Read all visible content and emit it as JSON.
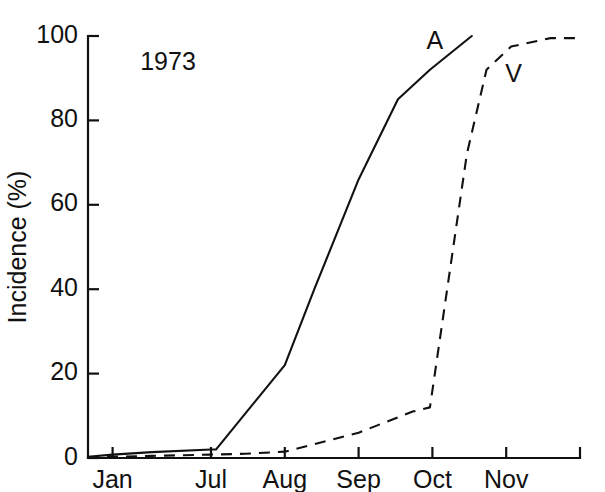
{
  "chart_data": {
    "type": "line",
    "title": "",
    "annotation": "1973",
    "xlabel": "",
    "ylabel": "Incidence (%)",
    "ylim": [
      0,
      100
    ],
    "yticks": [
      0,
      20,
      40,
      60,
      80,
      100
    ],
    "ytick_labels": [
      "0",
      "20",
      "40",
      "60",
      "80",
      "100"
    ],
    "xtick_labels": [
      "Jan",
      "Jul",
      "Aug",
      "Sep",
      "Oct",
      "Nov"
    ],
    "xtick_positions": [
      0.5,
      2.5,
      4.0,
      5.5,
      7.0,
      8.5
    ],
    "xlim": [
      0,
      10
    ],
    "grid": false,
    "legend_position": "inline-labels",
    "series": [
      {
        "name": "A",
        "label": "A",
        "style": "solid",
        "color": "#111111",
        "label_x": 7.05,
        "label_y": 97,
        "x": [
          0.0,
          0.5,
          1.3,
          2.5,
          2.6,
          4.0,
          4.6,
          5.5,
          6.3,
          6.95,
          7.8
        ],
        "y": [
          0.3,
          0.8,
          1.4,
          2.0,
          2.0,
          22.0,
          40.0,
          66.0,
          85.0,
          92.0,
          100.0
        ]
      },
      {
        "name": "V",
        "label": "V",
        "style": "dashed",
        "color": "#111111",
        "label_x": 8.65,
        "label_y": 89,
        "x": [
          0.0,
          0.5,
          1.3,
          2.5,
          3.2,
          4.0,
          5.5,
          6.6,
          6.95,
          7.3,
          7.7,
          8.1,
          8.6,
          9.4,
          10.0
        ],
        "y": [
          0.0,
          0.3,
          0.5,
          0.8,
          1.0,
          1.5,
          6.0,
          11.0,
          12.0,
          40.0,
          72.0,
          92.0,
          97.5,
          99.5,
          99.5
        ]
      }
    ]
  },
  "axes": {
    "y_axis_name": "y-axis",
    "x_axis_name": "x-axis"
  }
}
